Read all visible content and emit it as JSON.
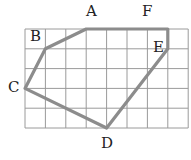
{
  "grid": {
    "cols": 8,
    "rows": 5,
    "x0": 25,
    "y0": 29,
    "cell_w": 20.4,
    "cell_h": 19.8,
    "line_color": "#9a9a9a"
  },
  "polygon": {
    "stroke_color": "#8c8c8c",
    "vertices": [
      {
        "name": "A",
        "gx": 3,
        "gy": 0
      },
      {
        "name": "F",
        "gx": 7,
        "gy": 0
      },
      {
        "name": "E",
        "gx": 7,
        "gy": 1
      },
      {
        "name": "D",
        "gx": 4,
        "gy": 5
      },
      {
        "name": "C",
        "gx": 0,
        "gy": 3
      },
      {
        "name": "B",
        "gx": 1,
        "gy": 1
      }
    ]
  },
  "labels": {
    "A": {
      "text": "A",
      "x": 86,
      "y": 4
    },
    "B": {
      "text": "B",
      "x": 30,
      "y": 29
    },
    "C": {
      "text": "C",
      "x": 8,
      "y": 80
    },
    "D": {
      "text": "D",
      "x": 101,
      "y": 136
    },
    "E": {
      "text": "E",
      "x": 153,
      "y": 40
    },
    "F": {
      "text": "F",
      "x": 142,
      "y": 4
    }
  }
}
